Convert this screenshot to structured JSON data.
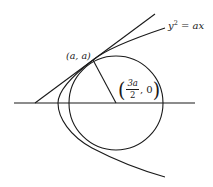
{
  "figure": {
    "curve_label_lhs": "y",
    "curve_label_exp": "2",
    "curve_label_rhs": " = ax",
    "point_label": "(a, a)",
    "center_label": {
      "open": "(",
      "numerator": "3a",
      "denominator": "2",
      "tail": ", 0",
      "close": ")"
    }
  },
  "colors": {
    "stroke": "#1a1a1a",
    "background": "#ffffff"
  }
}
